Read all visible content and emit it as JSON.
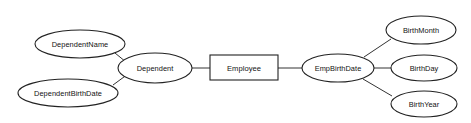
{
  "diagram": {
    "type": "entity-relationship-diagram",
    "background_color": "#ffffff",
    "stroke_color": "#222222",
    "edge_color": "#333333",
    "text_color": "#111111",
    "entities": [
      {
        "id": "employee",
        "label": "Employee",
        "shape": "rectangle",
        "x": 244,
        "y": 67,
        "w": 68,
        "h": 25
      }
    ],
    "attributes": [
      {
        "id": "dependent_name",
        "label": "DependentName",
        "shape": "ellipse",
        "cx": 80,
        "cy": 44,
        "rx": 45,
        "ry": 14
      },
      {
        "id": "dependent_birth_date",
        "label": "DependentBirthDate",
        "shape": "ellipse",
        "cx": 68,
        "cy": 93,
        "rx": 50,
        "ry": 14
      },
      {
        "id": "dependent",
        "label": "Dependent",
        "shape": "ellipse",
        "cx": 155,
        "cy": 68,
        "rx": 37,
        "ry": 15
      },
      {
        "id": "emp_birth_date",
        "label": "EmpBirthDate",
        "shape": "ellipse",
        "cx": 338,
        "cy": 68,
        "rx": 36,
        "ry": 14
      },
      {
        "id": "birth_month",
        "label": "BirthMonth",
        "shape": "ellipse",
        "cx": 421,
        "cy": 30,
        "rx": 35,
        "ry": 14
      },
      {
        "id": "birth_day",
        "label": "BirthDay",
        "shape": "ellipse",
        "cx": 424,
        "cy": 68,
        "rx": 33,
        "ry": 13
      },
      {
        "id": "birth_year",
        "label": "BirthYear",
        "shape": "ellipse",
        "cx": 424,
        "cy": 104,
        "rx": 33,
        "ry": 13
      }
    ],
    "edges": [
      {
        "id": "edge-dependentname-dependent",
        "from": "dependent_name",
        "to": "dependent",
        "x1": 115,
        "y1": 53,
        "x2": 126,
        "y2": 62
      },
      {
        "id": "edge-dependentbirthdate-dependent",
        "from": "dependent_birth_date",
        "to": "dependent",
        "x1": 113,
        "y1": 85,
        "x2": 128,
        "y2": 74
      },
      {
        "id": "edge-dependent-employee",
        "from": "dependent",
        "to": "employee",
        "x1": 192,
        "y1": 68,
        "x2": 210,
        "y2": 68
      },
      {
        "id": "edge-employee-empbirthdate",
        "from": "employee",
        "to": "emp_birth_date",
        "x1": 278,
        "y1": 68,
        "x2": 302,
        "y2": 68
      },
      {
        "id": "edge-empbirthdate-birthmonth",
        "from": "emp_birth_date",
        "to": "birth_month",
        "x1": 364,
        "y1": 57,
        "x2": 391,
        "y2": 39
      },
      {
        "id": "edge-empbirthdate-birthday",
        "from": "emp_birth_date",
        "to": "birth_day",
        "x1": 374,
        "y1": 68,
        "x2": 391,
        "y2": 68
      },
      {
        "id": "edge-empbirthdate-birthyear",
        "from": "emp_birth_date",
        "to": "birth_year",
        "x1": 363,
        "y1": 79,
        "x2": 392,
        "y2": 96
      }
    ]
  }
}
